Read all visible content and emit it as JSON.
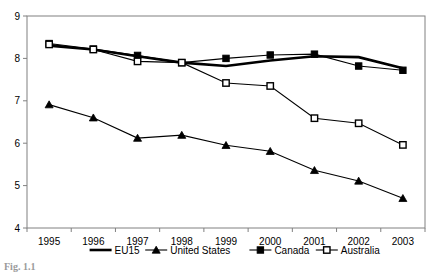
{
  "chart_data": {
    "type": "line",
    "title": "",
    "xlabel": "",
    "ylabel": "",
    "categories": [
      "1995",
      "1996",
      "1997",
      "1998",
      "1999",
      "2000",
      "2001",
      "2002",
      "2003"
    ],
    "ylim": [
      4,
      9
    ],
    "yticks": [
      4,
      5,
      6,
      7,
      8,
      9
    ],
    "grid": false,
    "legend_position": "bottom",
    "series": [
      {
        "name": "EU15",
        "marker": "none",
        "color": "#000000",
        "values": [
          8.3,
          8.21,
          8.05,
          7.9,
          7.82,
          7.95,
          8.05,
          8.03,
          7.77
        ]
      },
      {
        "name": "United States",
        "marker": "filled-triangle",
        "color": "#000000",
        "values": [
          6.91,
          6.6,
          6.12,
          6.19,
          5.95,
          5.81,
          5.36,
          5.11,
          4.7
        ]
      },
      {
        "name": "Canada",
        "marker": "filled-square",
        "color": "#000000",
        "values": [
          8.35,
          8.22,
          8.07,
          7.9,
          8.0,
          8.08,
          8.1,
          7.82,
          7.72
        ]
      },
      {
        "name": "Australia",
        "marker": "open-square",
        "color": "#000000",
        "values": [
          8.33,
          8.21,
          7.93,
          7.9,
          7.42,
          7.35,
          6.59,
          6.47,
          5.96
        ]
      }
    ]
  },
  "caption": {
    "text": "Fig. 1.1"
  }
}
